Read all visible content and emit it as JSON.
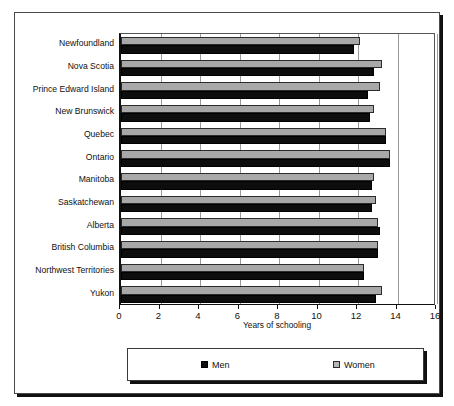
{
  "chart_data": {
    "type": "bar",
    "orientation": "horizontal",
    "title": "",
    "xlabel": "Years of schooling",
    "ylabel": "",
    "xlim": [
      0,
      16
    ],
    "xticks": [
      "0",
      "2",
      "4",
      "6",
      "8",
      "10",
      "12",
      "14",
      "16"
    ],
    "xtick_values": [
      0,
      2,
      4,
      6,
      8,
      10,
      12,
      14,
      16
    ],
    "grid": true,
    "grid_axis": "x",
    "legend_position": "bottom",
    "categories": [
      "Newfoundland",
      "Nova Scotia",
      "Prince Edward Island",
      "New Brunswick",
      "Quebec",
      "Ontario",
      "Manitoba",
      "Saskatchewan",
      "Alberta",
      "British Columbia",
      "Northwest Territories",
      "Yukon"
    ],
    "series": [
      {
        "name": "Women",
        "color": "#a8a8a8",
        "values": [
          12.1,
          13.2,
          13.1,
          12.8,
          13.4,
          13.6,
          12.8,
          12.9,
          13.0,
          13.0,
          12.3,
          13.2
        ]
      },
      {
        "name": "Men",
        "color": "#0d0d0d",
        "values": [
          11.8,
          12.8,
          12.5,
          12.6,
          13.4,
          13.6,
          12.7,
          12.7,
          13.1,
          13.0,
          12.3,
          12.9
        ]
      }
    ]
  },
  "axis": {
    "x_title": "Years of schooling"
  },
  "legend": {
    "items": [
      {
        "label": "Men",
        "swatch": "black-square-icon"
      },
      {
        "label": "Women",
        "swatch": "gray-square-icon"
      }
    ]
  }
}
